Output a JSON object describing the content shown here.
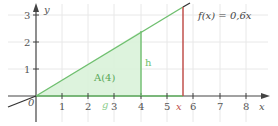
{
  "figure": {
    "function_label": "f(x) = 0,6x",
    "area_label": "A(4)",
    "height_label": "h",
    "base_label": "g",
    "variable_marker": "x",
    "x_axis_label": "x",
    "y_axis_label": "y",
    "origin_label": "0",
    "x_ticks": [
      "1",
      "2",
      "3",
      "4",
      "5",
      "6",
      "7",
      "8"
    ],
    "y_ticks": [
      "1",
      "2",
      "3"
    ],
    "colors": {
      "function_line": "#6fbf6f",
      "fill": "#d9f2d9",
      "height_line": "#6fbf6f",
      "variable_line": "#c0504d",
      "axis": "#444444",
      "grid": "#e6e6e6",
      "label": "#6fbf6f"
    }
  }
}
